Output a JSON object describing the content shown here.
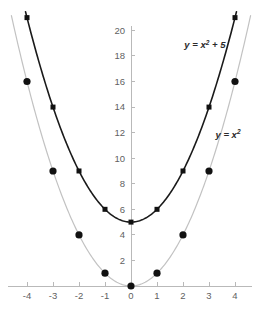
{
  "chart_data": {
    "type": "line",
    "title": "",
    "subtitle": "",
    "xlabel": "",
    "ylabel": "",
    "xlim": [
      -4.6,
      4.6
    ],
    "ylim": [
      0,
      21.6
    ],
    "grid": false,
    "legend_position": "inline-annotation",
    "x_ticks": [
      -4,
      -3,
      -2,
      -1,
      0,
      1,
      2,
      3,
      4
    ],
    "x_tick_labels": [
      "-4",
      "-3",
      "-2",
      "-1",
      "0",
      "1",
      "2",
      "3",
      "4"
    ],
    "y_ticks": [
      2,
      4,
      6,
      8,
      10,
      12,
      14,
      16,
      18,
      20
    ],
    "y_tick_labels": [
      "2",
      "4",
      "6",
      "8",
      "10",
      "12",
      "14",
      "16",
      "18",
      "20"
    ],
    "series": [
      {
        "name": "y = x² + 5",
        "label_main": "y = x",
        "label_sup": "2",
        "label_tail": " + 5",
        "color": "#1a1a1a",
        "line_width": 1.6,
        "marker": "square",
        "marker_size": 5,
        "x": [
          -4,
          -3,
          -2,
          -1,
          0,
          1,
          2,
          3,
          4
        ],
        "values": [
          21,
          14,
          9,
          6,
          5,
          6,
          9,
          14,
          21
        ],
        "annotation_x": 2.05,
        "annotation_y": 18.6
      },
      {
        "name": "y = x²",
        "label_main": "y = x",
        "label_sup": "2",
        "label_tail": "",
        "color": "#c2c2c2",
        "line_width": 1.2,
        "marker": "circle",
        "marker_size": 3.6,
        "x": [
          -4,
          -3,
          -2,
          -1,
          0,
          1,
          2,
          3,
          4
        ],
        "values": [
          16,
          9,
          4,
          1,
          0,
          1,
          4,
          9,
          16
        ],
        "annotation_x": 3.25,
        "annotation_y": 11.6
      }
    ],
    "axis_color": "#b9b9b9",
    "tick_label_color": "#5f5f5f",
    "background_color": "#ffffff"
  },
  "geometry": {
    "origin_x": 131,
    "origin_y": 286,
    "px_per_unit_x": 26.0,
    "px_per_unit_y": 12.78,
    "tick_len": 4
  }
}
